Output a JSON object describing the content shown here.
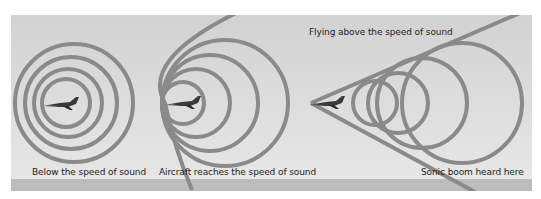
{
  "colors": {
    "panel_top": "#d2d2d2",
    "panel_bottom": "#e8e8e8",
    "ground": "#bcbcbc",
    "wave": "#8a8a8a",
    "text": "#222222",
    "aircraft": "#3a3a3a"
  },
  "panels": [
    {
      "id": "subsonic",
      "label": "Below the speed of sound"
    },
    {
      "id": "sonic",
      "label": "Aircraft reaches the speed of sound"
    },
    {
      "id": "supersonic",
      "label": "Flying above the speed of sound",
      "sublabel": "Sonic boom heard here"
    }
  ],
  "icons": [
    "aircraft-icon",
    "aircraft-icon",
    "aircraft-icon"
  ]
}
